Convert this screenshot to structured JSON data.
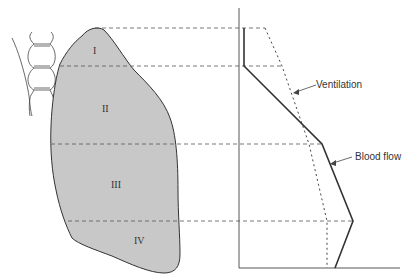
{
  "figure": {
    "type": "lung-zones-ventilation-perfusion",
    "zones": [
      {
        "label": "I",
        "x": 96,
        "y": 51
      },
      {
        "label": "II",
        "x": 106,
        "y": 110
      },
      {
        "label": "III",
        "x": 116,
        "y": 185
      },
      {
        "label": "IV",
        "x": 140,
        "y": 242
      }
    ],
    "zone_boundaries_y": [
      28,
      66,
      144,
      221
    ],
    "curves": [
      {
        "name": "Ventilation",
        "label": "Ventilation",
        "style": "dotted"
      },
      {
        "name": "Blood flow",
        "label": "Blood flow",
        "style": "solid"
      }
    ],
    "colors": {
      "lung_fill": "#c8c8c8",
      "line": "#333333",
      "dash": "#555555"
    }
  }
}
